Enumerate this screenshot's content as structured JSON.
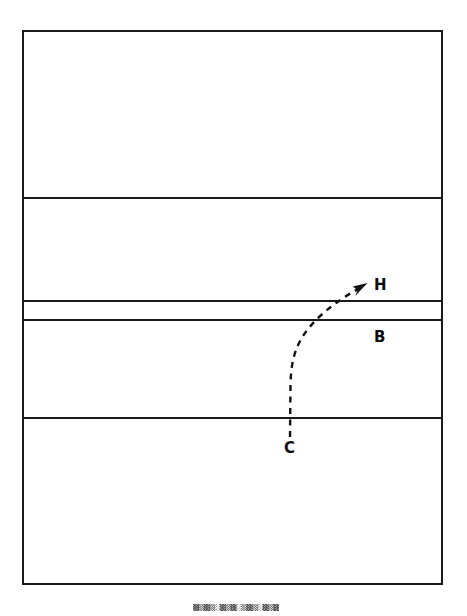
{
  "figure": {
    "background_color": "#ffffff",
    "line_color": "#1a1a1a",
    "canvas": {
      "width": 467,
      "height": 616
    }
  },
  "frame": {
    "name": "cross-section-frame",
    "x": 22,
    "y": 30,
    "width": 421,
    "height": 555,
    "stroke_width": 2.2
  },
  "strata": {
    "divider_y_values": [
      198,
      301,
      320,
      418
    ],
    "divider_stroke_width": 2.0,
    "layers": [
      {
        "id": "layer-1",
        "top": 30,
        "bottom": 198
      },
      {
        "id": "layer-2",
        "top": 198,
        "bottom": 301
      },
      {
        "id": "layer-3",
        "top": 301,
        "bottom": 320
      },
      {
        "id": "layer-4",
        "top": 320,
        "bottom": 418
      },
      {
        "id": "layer-5",
        "top": 418,
        "bottom": 585
      }
    ]
  },
  "flow": {
    "name": "migration-path",
    "style": "dashed",
    "dash_pattern": "6 5.5",
    "stroke_width": 2.4,
    "start_point": {
      "x": 290,
      "y": 437
    },
    "end_point": {
      "x": 366,
      "y": 284
    },
    "path_d": "M 290 437 L 290.5 385 C 291 352 300 336 318 318 C 334 303 350 293 364 286",
    "arrowhead_d": "M 367.5 283.0 L 352.8 286.6 L 357.6 290.3 L 355.2 295.9 Z"
  },
  "labels": [
    {
      "id": "label-h",
      "text": "H",
      "x": 374,
      "y": 290,
      "description": "upper marker at arrow tip"
    },
    {
      "id": "label-b",
      "text": "B",
      "x": 374,
      "y": 342,
      "description": "marker below thin band"
    },
    {
      "id": "label-c",
      "text": "C",
      "x": 284,
      "y": 453,
      "description": "lower marker at path origin"
    }
  ],
  "caption": {
    "name": "degraded-caption",
    "text": "▓▒▓▒░▓▒▓░▒▓▒░▓▒▓░▒▓▒▓",
    "legible": false,
    "note": "illegible scan artifact at page bottom"
  }
}
